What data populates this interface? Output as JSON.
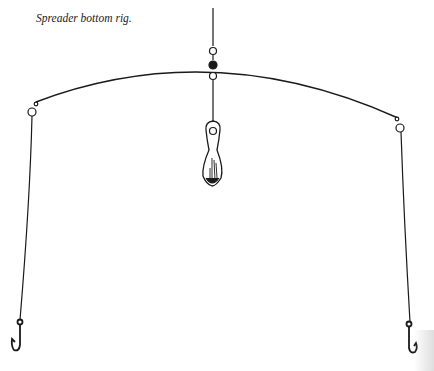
{
  "caption": "Spreader bottom rig.",
  "illustration": {
    "subject": "spreader bottom rig",
    "parts": [
      "main-line",
      "swivels",
      "spreader-wire",
      "sinker",
      "left-hook",
      "right-hook"
    ]
  },
  "colors": {
    "ink": "#1a1a1a",
    "background": "#ffffff"
  }
}
